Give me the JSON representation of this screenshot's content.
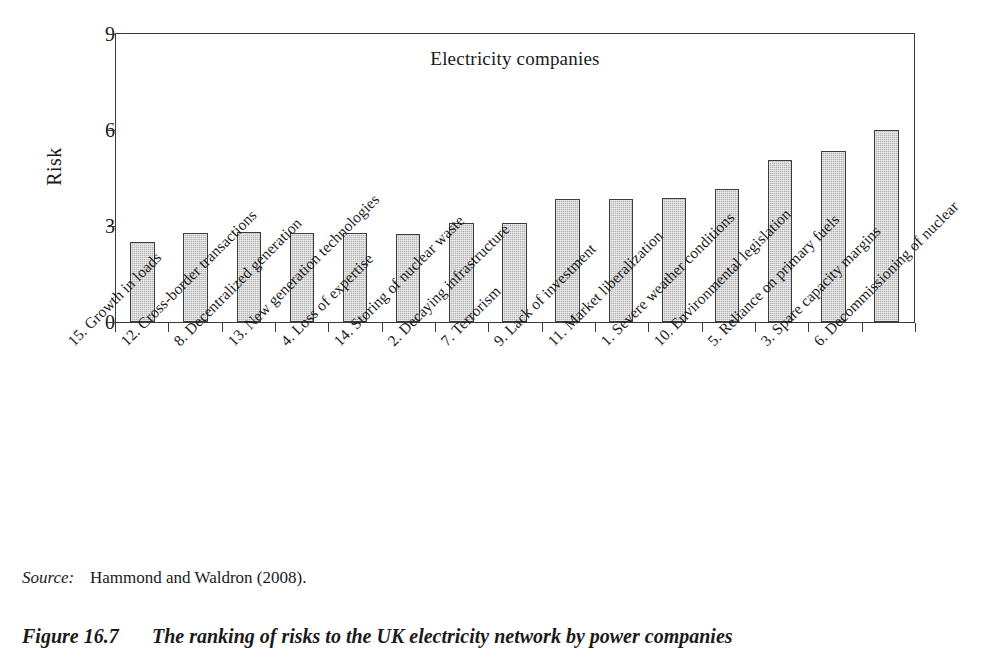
{
  "chart_data": {
    "type": "bar",
    "title": "Electricity companies",
    "xlabel": "",
    "ylabel": "Risk",
    "ylim": [
      0,
      9
    ],
    "yticks": [
      0,
      3,
      6,
      9
    ],
    "grid": false,
    "legend": "none",
    "orientation": "vertical",
    "bar_color": "#b4b4b4",
    "bar_edge_color": "#3d3d3d",
    "categories": [
      "15. Growth in loads",
      "12. Cross-border transactions",
      "8. Decentralized generation",
      "13. New generation technologies",
      "4. Loss of expertise",
      "14. Storing of nuclear waste",
      "2. Decaying infrastructure",
      "7. Terrorism",
      "9. Lack of investment",
      "11. Market liberalization",
      "1. Severe weather conditions",
      "10. Environmental legislation",
      "5. Reliance on primary fuels",
      "3. Spare capacity margins",
      "6. Decommissioning of nuclear"
    ],
    "values": [
      2.5,
      2.78,
      2.82,
      2.78,
      2.78,
      2.76,
      3.1,
      3.08,
      3.85,
      3.85,
      3.88,
      4.15,
      5.05,
      5.35,
      6.0
    ]
  },
  "chart": {
    "title": "Electricity companies",
    "y_axis_label": "Risk",
    "y_tick_labels": [
      "9",
      "6",
      "3",
      "0"
    ]
  },
  "source": {
    "label": "Source:",
    "text": "Hammond and Waldron (2008)."
  },
  "caption": {
    "number": "Figure 16.7",
    "text": "The ranking of risks to the UK electricity network by power companies"
  }
}
